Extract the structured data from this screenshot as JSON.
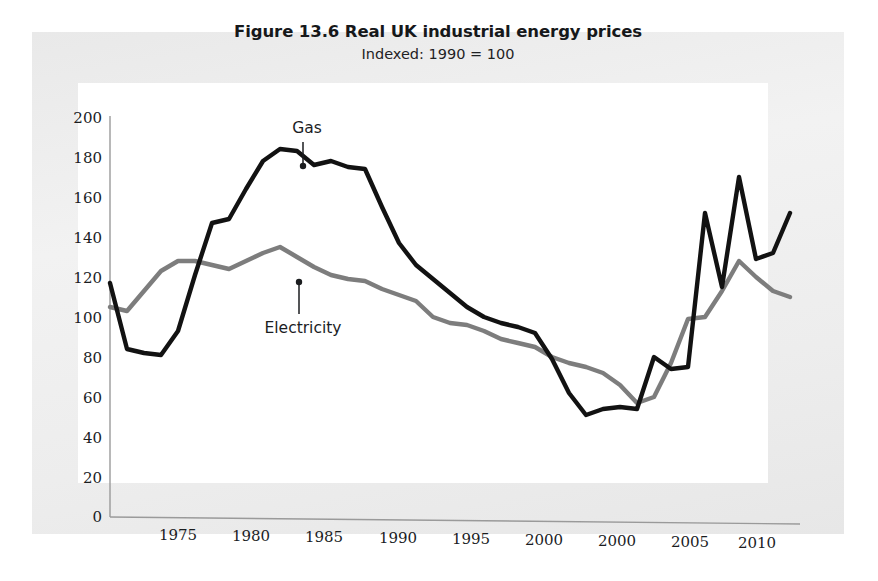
{
  "figure": {
    "title": "Figure 13.6 Real UK industrial energy prices",
    "subtitle": "Indexed: 1990 = 100",
    "gas_label": "Gas",
    "electricity_label": "Electricity",
    "gas_color": "#121212",
    "electricity_color": "#7d7d7d",
    "panel_color": "#ededed",
    "plot_background": "#ffffff"
  },
  "chart_data": {
    "type": "line",
    "title": "Figure 13.6 Real UK industrial energy prices",
    "subtitle": "Indexed: 1990 = 100",
    "xlabel": "",
    "ylabel": "",
    "ylim": [
      0,
      200
    ],
    "yticks": [
      0,
      20,
      40,
      60,
      80,
      100,
      120,
      140,
      160,
      180,
      200
    ],
    "xtick_labels": [
      "1975",
      "1980",
      "1985",
      "1990",
      "1995",
      "2000",
      "2000",
      "2005",
      "2010"
    ],
    "xtick_years": [
      1975,
      1980,
      1985,
      1990,
      1995,
      2000,
      2000,
      2005,
      2010
    ],
    "xlim": [
      1971,
      2011
    ],
    "grid": false,
    "legend": "annotations",
    "annotations": [
      {
        "text": "Gas",
        "points_to_year": 1984,
        "points_to_value": 178,
        "direction": "down"
      },
      {
        "text": "Electricity",
        "points_to_year": 1984,
        "points_to_value": 127,
        "direction": "up"
      }
    ],
    "x": [
      1971,
      1972,
      1973,
      1974,
      1975,
      1976,
      1977,
      1978,
      1979,
      1980,
      1981,
      1982,
      1983,
      1984,
      1985,
      1986,
      1987,
      1988,
      1989,
      1990,
      1991,
      1992,
      1993,
      1994,
      1995,
      1996,
      1997,
      1998,
      1999,
      2000,
      2001,
      2002,
      2003,
      2004,
      2005,
      2006,
      2007,
      2008,
      2009,
      2010,
      2011
    ],
    "series": [
      {
        "name": "Gas",
        "color": "#121212",
        "values": [
          117,
          84,
          82,
          81,
          93,
          121,
          147,
          149,
          164,
          178,
          184,
          183,
          176,
          178,
          175,
          174,
          155,
          137,
          126,
          119,
          112,
          105,
          100,
          97,
          95,
          92,
          79,
          62,
          51,
          54,
          55,
          54,
          80,
          74,
          75,
          152,
          115,
          170,
          129,
          132,
          152
        ]
      },
      {
        "name": "Electricity",
        "color": "#7d7d7d",
        "values": [
          105,
          103,
          113,
          123,
          128,
          128,
          126,
          124,
          128,
          132,
          135,
          130,
          125,
          121,
          119,
          118,
          114,
          111,
          108,
          100,
          97,
          96,
          93,
          89,
          87,
          85,
          80,
          77,
          75,
          72,
          66,
          57,
          60,
          77,
          99,
          100,
          113,
          128,
          120,
          113,
          110
        ]
      }
    ]
  }
}
